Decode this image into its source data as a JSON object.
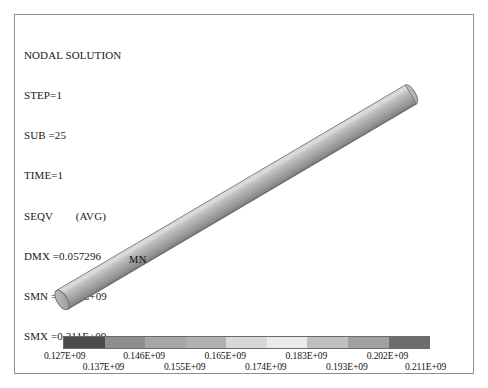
{
  "header": {
    "lines": [
      "NODAL SOLUTION",
      "STEP=1",
      "SUB =25",
      "TIME=1",
      "SEQV        (AVG)",
      "DMX =0.057296",
      "SMN =0.127E+09",
      "SMX =0.211E+09"
    ],
    "title": "NODAL SOLUTION",
    "step": "STEP=1",
    "sub": "SUB =25",
    "time": "TIME=1",
    "result_type": "SEQV        (AVG)",
    "dmx": "DMX =0.057296",
    "smn": "SMN =0.127E+09",
    "smx": "SMX =0.211E+09"
  },
  "annotations": {
    "min_node_label": "MN"
  },
  "chart_data": {
    "type": "heatmap",
    "title": "NODAL SOLUTION",
    "subtitle": "SEQV        (AVG)",
    "xlabel": "",
    "ylabel": "",
    "legend_position": "bottom",
    "grid": false,
    "colormap": "grayscale-banded",
    "value_min": 127000000,
    "value_max": 211000000,
    "max_displacement": 0.057296,
    "tick_labels": [
      "0.127E+09",
      "0.137E+09",
      "0.146E+09",
      "0.155E+09",
      "0.165E+09",
      "0.174E+09",
      "0.183E+09",
      "0.193E+09",
      "0.202E+09",
      "0.211E+09"
    ],
    "tick_values": [
      127000000,
      137000000,
      146000000,
      155000000,
      165000000,
      174000000,
      183000000,
      193000000,
      202000000,
      211000000
    ],
    "band_colors": [
      "#4a4a4a",
      "#8e8e8e",
      "#a6a6a6",
      "#b0b0b0",
      "#d8d8d8",
      "#ebebeb",
      "#c0c0c0",
      "#a0a0a0",
      "#6d6d6d"
    ],
    "band_count": 9,
    "geometry": "cylindrical rod, diagonal from lower-left to upper-right"
  },
  "colors": {
    "frame": "#8d8d8d",
    "text": "#141414",
    "rod_light": "#d9d9d9",
    "rod_mid": "#a8a8a8",
    "rod_dark": "#7c7c7c"
  }
}
